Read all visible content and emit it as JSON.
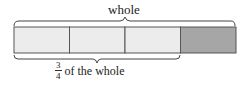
{
  "diagram": {
    "top_label": "whole",
    "bottom_label": {
      "numerator": "3",
      "denominator": "4",
      "text": "of the whole"
    },
    "bar": {
      "segments": 4,
      "shaded_segments": [
        4
      ],
      "light_color": "#ececec",
      "shaded_color": "#a6a6a6",
      "border_color": "#555555"
    }
  }
}
